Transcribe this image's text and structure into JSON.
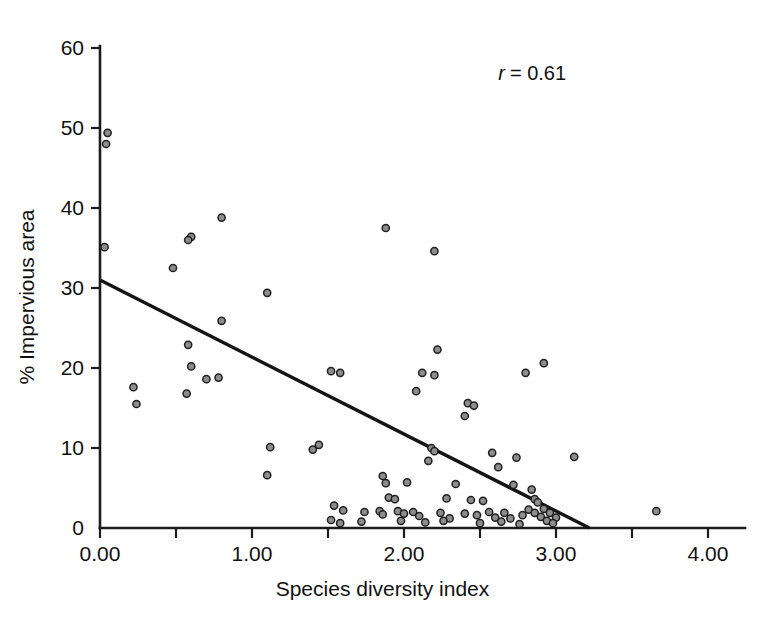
{
  "chart_data": {
    "type": "scatter",
    "title": "",
    "xlabel": "Species diversity index",
    "ylabel": "% Impervious area",
    "xlim": [
      0.0,
      4.24
    ],
    "ylim": [
      0,
      63.5
    ],
    "xticks": [
      0.0,
      0.5,
      1.0,
      1.5,
      2.0,
      2.5,
      3.0,
      3.5,
      4.0
    ],
    "xtick_labels": [
      "0.00",
      "",
      "1.00",
      "",
      "2.00",
      "",
      "3.00",
      "",
      "4.00"
    ],
    "yticks": [
      0,
      10,
      20,
      30,
      40,
      50,
      60
    ],
    "ytick_labels": [
      "0",
      "10",
      "20",
      "30",
      "40",
      "50",
      "60"
    ],
    "grid": false,
    "legend": null,
    "annotations": [
      {
        "name": "correlation-annotation",
        "symbol": "r",
        "text": "= 0.61",
        "full_text": "r = 0.61",
        "x": 2.62,
        "y": 56.0
      }
    ],
    "trendline": {
      "name": "regression-line",
      "x0": 0.0,
      "y0": 31.0,
      "x1": 3.22,
      "y1": 0.0,
      "color": "#141414"
    },
    "marker_style": {
      "shape": "circle",
      "radius": 3.6,
      "fill": "#8d8d8d",
      "edge": "#1f1f1f"
    },
    "points": [
      {
        "x": 0.05,
        "y": 49.4
      },
      {
        "x": 0.04,
        "y": 48.0
      },
      {
        "x": 0.03,
        "y": 35.1
      },
      {
        "x": 0.8,
        "y": 38.8
      },
      {
        "x": 1.88,
        "y": 37.5
      },
      {
        "x": 0.6,
        "y": 36.4
      },
      {
        "x": 0.58,
        "y": 36.0
      },
      {
        "x": 2.2,
        "y": 34.6
      },
      {
        "x": 0.48,
        "y": 32.5
      },
      {
        "x": 1.1,
        "y": 29.4
      },
      {
        "x": 0.8,
        "y": 25.9
      },
      {
        "x": 0.58,
        "y": 22.9
      },
      {
        "x": 2.22,
        "y": 22.3
      },
      {
        "x": 0.6,
        "y": 20.2
      },
      {
        "x": 2.92,
        "y": 20.6
      },
      {
        "x": 1.52,
        "y": 19.6
      },
      {
        "x": 1.58,
        "y": 19.4
      },
      {
        "x": 2.12,
        "y": 19.4
      },
      {
        "x": 2.2,
        "y": 19.1
      },
      {
        "x": 2.8,
        "y": 19.4
      },
      {
        "x": 0.78,
        "y": 18.8
      },
      {
        "x": 0.7,
        "y": 18.6
      },
      {
        "x": 0.22,
        "y": 17.6
      },
      {
        "x": 2.08,
        "y": 17.1
      },
      {
        "x": 0.57,
        "y": 16.8
      },
      {
        "x": 0.24,
        "y": 15.5
      },
      {
        "x": 2.42,
        "y": 15.6
      },
      {
        "x": 2.46,
        "y": 15.3
      },
      {
        "x": 2.4,
        "y": 14.0
      },
      {
        "x": 1.12,
        "y": 10.1
      },
      {
        "x": 1.44,
        "y": 10.4
      },
      {
        "x": 2.18,
        "y": 10.0
      },
      {
        "x": 2.2,
        "y": 9.6
      },
      {
        "x": 1.4,
        "y": 9.8
      },
      {
        "x": 2.58,
        "y": 9.4
      },
      {
        "x": 3.12,
        "y": 8.9
      },
      {
        "x": 2.16,
        "y": 8.4
      },
      {
        "x": 2.74,
        "y": 8.8
      },
      {
        "x": 2.62,
        "y": 7.6
      },
      {
        "x": 1.1,
        "y": 6.6
      },
      {
        "x": 1.86,
        "y": 6.5
      },
      {
        "x": 1.88,
        "y": 5.6
      },
      {
        "x": 2.02,
        "y": 5.7
      },
      {
        "x": 2.34,
        "y": 5.5
      },
      {
        "x": 2.72,
        "y": 5.4
      },
      {
        "x": 2.84,
        "y": 4.8
      },
      {
        "x": 1.9,
        "y": 3.8
      },
      {
        "x": 1.94,
        "y": 3.6
      },
      {
        "x": 2.28,
        "y": 3.7
      },
      {
        "x": 2.44,
        "y": 3.5
      },
      {
        "x": 2.52,
        "y": 3.4
      },
      {
        "x": 2.86,
        "y": 3.6
      },
      {
        "x": 2.88,
        "y": 3.2
      },
      {
        "x": 1.54,
        "y": 2.8
      },
      {
        "x": 1.6,
        "y": 2.2
      },
      {
        "x": 1.74,
        "y": 2.0
      },
      {
        "x": 1.84,
        "y": 2.1
      },
      {
        "x": 1.86,
        "y": 1.7
      },
      {
        "x": 1.96,
        "y": 2.1
      },
      {
        "x": 2.0,
        "y": 1.8
      },
      {
        "x": 2.06,
        "y": 2.0
      },
      {
        "x": 2.1,
        "y": 1.5
      },
      {
        "x": 2.24,
        "y": 1.9
      },
      {
        "x": 2.3,
        "y": 1.2
      },
      {
        "x": 2.4,
        "y": 1.8
      },
      {
        "x": 2.48,
        "y": 1.6
      },
      {
        "x": 2.56,
        "y": 2.0
      },
      {
        "x": 2.6,
        "y": 1.3
      },
      {
        "x": 2.66,
        "y": 1.9
      },
      {
        "x": 2.7,
        "y": 1.2
      },
      {
        "x": 2.78,
        "y": 1.6
      },
      {
        "x": 2.82,
        "y": 2.3
      },
      {
        "x": 2.86,
        "y": 1.9
      },
      {
        "x": 2.9,
        "y": 1.4
      },
      {
        "x": 2.92,
        "y": 2.4
      },
      {
        "x": 2.94,
        "y": 0.9
      },
      {
        "x": 2.96,
        "y": 1.9
      },
      {
        "x": 3.0,
        "y": 1.3
      },
      {
        "x": 1.52,
        "y": 1.0
      },
      {
        "x": 1.58,
        "y": 0.6
      },
      {
        "x": 1.72,
        "y": 0.8
      },
      {
        "x": 1.98,
        "y": 0.9
      },
      {
        "x": 2.14,
        "y": 0.7
      },
      {
        "x": 2.26,
        "y": 0.9
      },
      {
        "x": 2.5,
        "y": 0.6
      },
      {
        "x": 2.64,
        "y": 0.8
      },
      {
        "x": 2.76,
        "y": 0.5
      },
      {
        "x": 2.98,
        "y": 0.6
      },
      {
        "x": 3.66,
        "y": 2.1
      }
    ]
  }
}
